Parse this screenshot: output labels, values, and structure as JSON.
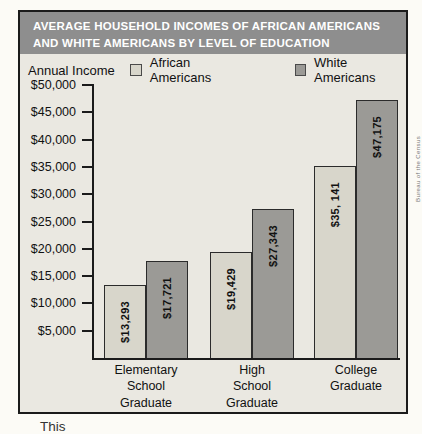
{
  "header": {
    "title_line1": "AVERAGE HOUSEHOLD INCOMES OF AFRICAN AMERICANS",
    "title_line2": "AND WHITE AMERICANS BY LEVEL OF EDUCATION"
  },
  "legend": {
    "axis_label": "Annual Income",
    "items": [
      {
        "label": "African Americans",
        "color": "#d8d6cb"
      },
      {
        "label": "White Americans",
        "color": "#9b9a96"
      }
    ]
  },
  "chart_data": {
    "type": "bar",
    "title": "AVERAGE HOUSEHOLD INCOMES OF AFRICAN AMERICANS AND WHITE AMERICANS BY LEVEL OF EDUCATION",
    "ylabel": "Annual Income",
    "xlabel": "",
    "grid": false,
    "legend_position": "top",
    "ylim": [
      0,
      50000
    ],
    "ytick_values": [
      50000,
      45000,
      40000,
      35000,
      30000,
      25000,
      20000,
      15000,
      10000,
      5000
    ],
    "ytick_labels": [
      "$50,000",
      "$45,000",
      "$40,000",
      "$35,000",
      "$30,000",
      "$25,000",
      "$20,000",
      "$15,000",
      "$10,000",
      "$5,000"
    ],
    "categories": [
      [
        "Elementary",
        "School",
        "Graduate"
      ],
      [
        "High",
        "School",
        "Graduate"
      ],
      [
        "College",
        "Graduate"
      ]
    ],
    "series": [
      {
        "name": "African Americans",
        "values": [
          13293,
          19429,
          35141
        ],
        "labels": [
          "$13,293",
          "$19,429",
          "$35, 141"
        ],
        "color": "#d8d6cb"
      },
      {
        "name": "White Americans",
        "values": [
          17721,
          27343,
          47175
        ],
        "labels": [
          "$17,721",
          "$27,343",
          "$47,175"
        ],
        "color": "#9b9a96"
      }
    ],
    "layout": {
      "bar_width": 42,
      "group_lefts": [
        10,
        116,
        220
      ],
      "plot_height_px": 273
    }
  },
  "side_caption": "Bureau of the Census",
  "bottom_caption": "This"
}
